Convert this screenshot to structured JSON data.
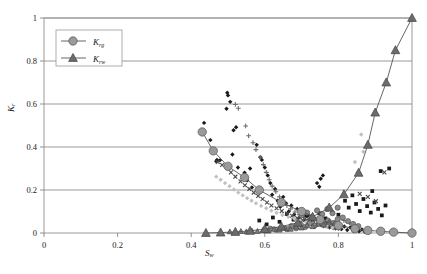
{
  "chart_data": {
    "type": "scatter",
    "title": "",
    "xlabel": "S",
    "xlabel_sub": "w",
    "ylabel": "K",
    "ylabel_sub": "r",
    "xlim": [
      0,
      1
    ],
    "ylim": [
      0,
      1
    ],
    "xticks": [
      "0",
      "0.2",
      "0.4",
      "0.6",
      "0.8",
      "1"
    ],
    "xtick_values": [
      0,
      0.2,
      0.4,
      0.6,
      0.8,
      1
    ],
    "yticks": [
      "0",
      "0.2",
      "0.4",
      "0.6",
      "0.8",
      "1"
    ],
    "ytick_values": [
      0,
      0.2,
      0.4,
      0.6,
      0.8,
      1
    ],
    "grid": "horizontal",
    "legend_position": "top-left",
    "colors": {
      "krg_marker": "#9a9a9a",
      "krw_marker": "#6b6b6b",
      "curve_line": "#555555",
      "grid": "#808080",
      "frame": "#999999",
      "scatter_dark": "#1a1a1a",
      "scatter_mid": "#6e6e6e",
      "scatter_light": "#c0c0c0"
    },
    "series": [
      {
        "name": "K",
        "name_sub": "rg",
        "legend_label": "Krg",
        "marker": "circle",
        "color": "#9a9a9a",
        "x": [
          0.43,
          0.46,
          0.5,
          0.545,
          0.585,
          0.645,
          0.7,
          0.75,
          0.8,
          0.845,
          0.88,
          0.915,
          0.95,
          1.0
        ],
        "y": [
          0.47,
          0.382,
          0.31,
          0.258,
          0.2,
          0.142,
          0.1,
          0.062,
          0.035,
          0.02,
          0.012,
          0.008,
          0.004,
          0.0
        ]
      },
      {
        "name": "K",
        "name_sub": "rw",
        "legend_label": "Krw",
        "marker": "triangle",
        "color": "#6b6b6b",
        "x": [
          0.44,
          0.48,
          0.52,
          0.56,
          0.6,
          0.645,
          0.69,
          0.73,
          0.775,
          0.815,
          0.855,
          0.88,
          0.9,
          0.93,
          0.955,
          1.0
        ],
        "y": [
          0.0,
          0.002,
          0.005,
          0.01,
          0.018,
          0.03,
          0.048,
          0.075,
          0.118,
          0.18,
          0.28,
          0.41,
          0.56,
          0.7,
          0.85,
          1.0
        ]
      }
    ],
    "scatter_clouds": [
      {
        "name": "dark-diamonds",
        "marker": "diamond",
        "color": "#1a1a1a",
        "points": [
          [
            0.435,
            0.512
          ],
          [
            0.452,
            0.432
          ],
          [
            0.47,
            0.34
          ],
          [
            0.468,
            0.334
          ],
          [
            0.478,
            0.338
          ],
          [
            0.498,
            0.652
          ],
          [
            0.5,
            0.64
          ],
          [
            0.496,
            0.578
          ],
          [
            0.506,
            0.61
          ],
          [
            0.515,
            0.478
          ],
          [
            0.522,
            0.492
          ],
          [
            0.512,
            0.365
          ],
          [
            0.527,
            0.305
          ],
          [
            0.545,
            0.28
          ],
          [
            0.552,
            0.245
          ],
          [
            0.56,
            0.3
          ],
          [
            0.565,
            0.212
          ],
          [
            0.578,
            0.41
          ],
          [
            0.588,
            0.352
          ],
          [
            0.592,
            0.34
          ],
          [
            0.6,
            0.305
          ],
          [
            0.608,
            0.268
          ],
          [
            0.615,
            0.232
          ],
          [
            0.62,
            0.178
          ],
          [
            0.628,
            0.205
          ],
          [
            0.635,
            0.15
          ],
          [
            0.642,
            0.122
          ],
          [
            0.65,
            0.168
          ],
          [
            0.658,
            0.138
          ],
          [
            0.665,
            0.1
          ],
          [
            0.672,
            0.128
          ],
          [
            0.68,
            0.086
          ],
          [
            0.688,
            0.112
          ],
          [
            0.695,
            0.07
          ],
          [
            0.702,
            0.095
          ],
          [
            0.71,
            0.06
          ],
          [
            0.718,
            0.082
          ],
          [
            0.726,
            0.048
          ],
          [
            0.734,
            0.07
          ],
          [
            0.742,
            0.04
          ],
          [
            0.75,
            0.058
          ],
          [
            0.742,
            0.232
          ],
          [
            0.752,
            0.252
          ],
          [
            0.758,
            0.268
          ],
          [
            0.748,
            0.215
          ],
          [
            0.76,
            0.035
          ],
          [
            0.768,
            0.052
          ],
          [
            0.776,
            0.028
          ],
          [
            0.784,
            0.044
          ],
          [
            0.792,
            0.022
          ],
          [
            0.8,
            0.038
          ],
          [
            0.808,
            0.018
          ],
          [
            0.816,
            0.03
          ],
          [
            0.824,
            0.014
          ],
          [
            0.832,
            0.026
          ],
          [
            0.84,
            0.01
          ],
          [
            0.848,
            0.02
          ],
          [
            0.856,
            0.008
          ],
          [
            0.864,
            0.016
          ],
          [
            0.872,
            0.006
          ],
          [
            0.88,
            0.012
          ]
        ]
      },
      {
        "name": "dark-squares",
        "marker": "square",
        "color": "#1a1a1a",
        "points": [
          [
            0.585,
            0.058
          ],
          [
            0.605,
            0.04
          ],
          [
            0.622,
            0.072
          ],
          [
            0.64,
            0.052
          ],
          [
            0.66,
            0.088
          ],
          [
            0.678,
            0.062
          ],
          [
            0.695,
            0.045
          ],
          [
            0.712,
            0.078
          ],
          [
            0.73,
            0.055
          ],
          [
            0.748,
            0.092
          ],
          [
            0.765,
            0.068
          ],
          [
            0.782,
            0.048
          ],
          [
            0.8,
            0.085
          ],
          [
            0.818,
            0.15
          ],
          [
            0.828,
            0.118
          ],
          [
            0.838,
            0.175
          ],
          [
            0.848,
            0.135
          ],
          [
            0.858,
            0.102
          ],
          [
            0.868,
            0.158
          ],
          [
            0.878,
            0.125
          ],
          [
            0.888,
            0.095
          ],
          [
            0.898,
            0.142
          ],
          [
            0.908,
            0.112
          ],
          [
            0.918,
            0.082
          ],
          [
            0.928,
            0.128
          ],
          [
            0.938,
            0.3
          ],
          [
            0.915,
            0.288
          ],
          [
            0.892,
            0.195
          ]
        ]
      },
      {
        "name": "gray-plus",
        "marker": "plus",
        "color": "#6e6e6e",
        "points": [
          [
            0.52,
            0.598
          ],
          [
            0.528,
            0.58
          ],
          [
            0.548,
            0.498
          ],
          [
            0.556,
            0.452
          ],
          [
            0.568,
            0.42
          ],
          [
            0.576,
            0.388
          ],
          [
            0.588,
            0.352
          ],
          [
            0.596,
            0.318
          ],
          [
            0.604,
            0.282
          ],
          [
            0.612,
            0.248
          ],
          [
            0.62,
            0.218
          ],
          [
            0.63,
            0.192
          ],
          [
            0.64,
            0.168
          ],
          [
            0.65,
            0.148
          ],
          [
            0.66,
            0.128
          ],
          [
            0.67,
            0.112
          ],
          [
            0.682,
            0.098
          ],
          [
            0.694,
            0.085
          ],
          [
            0.706,
            0.072
          ],
          [
            0.718,
            0.062
          ],
          [
            0.73,
            0.052
          ],
          [
            0.744,
            0.044
          ],
          [
            0.758,
            0.036
          ],
          [
            0.772,
            0.03
          ],
          [
            0.786,
            0.024
          ],
          [
            0.8,
            0.02
          ],
          [
            0.815,
            0.058
          ],
          [
            0.83,
            0.048
          ]
        ]
      },
      {
        "name": "gray-x",
        "marker": "x",
        "color": "#4a4a4a",
        "points": [
          [
            0.472,
            0.33
          ],
          [
            0.484,
            0.316
          ],
          [
            0.508,
            0.282
          ],
          [
            0.52,
            0.262
          ],
          [
            0.534,
            0.24
          ],
          [
            0.546,
            0.222
          ],
          [
            0.558,
            0.205
          ],
          [
            0.57,
            0.188
          ],
          [
            0.582,
            0.172
          ],
          [
            0.594,
            0.158
          ],
          [
            0.606,
            0.142
          ],
          [
            0.618,
            0.128
          ],
          [
            0.632,
            0.115
          ],
          [
            0.646,
            0.102
          ],
          [
            0.66,
            0.09
          ],
          [
            0.674,
            0.08
          ],
          [
            0.688,
            0.07
          ],
          [
            0.702,
            0.06
          ],
          [
            0.716,
            0.052
          ],
          [
            0.732,
            0.044
          ],
          [
            0.748,
            0.038
          ],
          [
            0.764,
            0.032
          ],
          [
            0.78,
            0.026
          ],
          [
            0.796,
            0.022
          ],
          [
            0.858,
            0.182
          ],
          [
            0.88,
            0.168
          ],
          [
            0.902,
            0.148
          ],
          [
            0.925,
            0.282
          ]
        ]
      },
      {
        "name": "light-diamonds",
        "marker": "diamond",
        "color": "#c0c0c0",
        "points": [
          [
            0.468,
            0.262
          ],
          [
            0.48,
            0.248
          ],
          [
            0.492,
            0.232
          ],
          [
            0.504,
            0.218
          ],
          [
            0.516,
            0.202
          ],
          [
            0.528,
            0.188
          ],
          [
            0.54,
            0.175
          ],
          [
            0.552,
            0.162
          ],
          [
            0.564,
            0.15
          ],
          [
            0.576,
            0.138
          ],
          [
            0.59,
            0.126
          ],
          [
            0.604,
            0.115
          ],
          [
            0.618,
            0.104
          ],
          [
            0.632,
            0.094
          ],
          [
            0.648,
            0.084
          ],
          [
            0.664,
            0.075
          ],
          [
            0.68,
            0.066
          ],
          [
            0.696,
            0.058
          ],
          [
            0.712,
            0.05
          ],
          [
            0.73,
            0.043
          ],
          [
            0.748,
            0.036
          ],
          [
            0.766,
            0.03
          ],
          [
            0.784,
            0.025
          ],
          [
            0.802,
            0.02
          ],
          [
            0.862,
            0.458
          ],
          [
            0.868,
            0.378
          ],
          [
            0.845,
            0.33
          ],
          [
            0.852,
            0.282
          ]
        ]
      },
      {
        "name": "mid-gray-blobs",
        "marker": "circle",
        "color": "#8a8a8a",
        "points": [
          [
            0.6,
            0.012
          ],
          [
            0.615,
            0.02
          ],
          [
            0.63,
            0.015
          ],
          [
            0.645,
            0.025
          ],
          [
            0.66,
            0.018
          ],
          [
            0.672,
            0.032
          ],
          [
            0.685,
            0.022
          ],
          [
            0.698,
            0.038
          ],
          [
            0.71,
            0.028
          ],
          [
            0.722,
            0.045
          ],
          [
            0.735,
            0.034
          ],
          [
            0.748,
            0.052
          ],
          [
            0.76,
            0.04
          ],
          [
            0.772,
            0.058
          ],
          [
            0.785,
            0.046
          ],
          [
            0.798,
            0.064
          ],
          [
            0.7,
            0.082
          ],
          [
            0.715,
            0.095
          ],
          [
            0.728,
            0.075
          ],
          [
            0.742,
            0.105
          ],
          [
            0.756,
            0.088
          ],
          [
            0.77,
            0.112
          ],
          [
            0.784,
            0.092
          ],
          [
            0.798,
            0.118
          ],
          [
            0.812,
            0.072
          ],
          [
            0.826,
            0.055
          ],
          [
            0.84,
            0.042
          ],
          [
            0.854,
            0.032
          ]
        ]
      },
      {
        "name": "baseline-triangles",
        "marker": "triangle",
        "color": "#7a7a7a",
        "points": [
          [
            0.505,
            0.006
          ],
          [
            0.52,
            0.004
          ],
          [
            0.535,
            0.008
          ],
          [
            0.55,
            0.006
          ],
          [
            0.565,
            0.01
          ],
          [
            0.58,
            0.008
          ],
          [
            0.595,
            0.014
          ],
          [
            0.61,
            0.01
          ],
          [
            0.625,
            0.018
          ],
          [
            0.64,
            0.014
          ],
          [
            0.655,
            0.022
          ],
          [
            0.67,
            0.018
          ],
          [
            0.685,
            0.028
          ],
          [
            0.7,
            0.024
          ],
          [
            0.715,
            0.035
          ],
          [
            0.73,
            0.03
          ],
          [
            0.745,
            0.042
          ],
          [
            0.76,
            0.038
          ],
          [
            0.775,
            0.05
          ],
          [
            0.79,
            0.045
          ]
        ]
      }
    ]
  },
  "legend": {
    "entries": [
      {
        "marker": "circle",
        "label": "K",
        "sub": "rg"
      },
      {
        "marker": "triangle",
        "label": "K",
        "sub": "rw"
      }
    ]
  }
}
